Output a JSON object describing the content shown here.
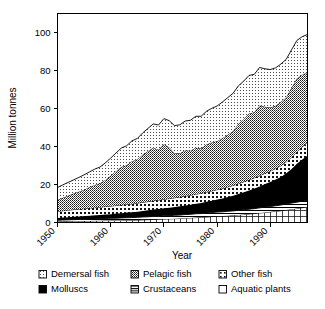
{
  "chart_data": {
    "type": "area",
    "title": "",
    "xlabel": "Year",
    "ylabel": "Million tonnes",
    "xlim": [
      1950,
      1997
    ],
    "ylim": [
      0,
      110
    ],
    "yticks": [
      0,
      20,
      40,
      60,
      80,
      100
    ],
    "xticks": [
      1950,
      1960,
      1970,
      1980,
      1990
    ],
    "grid": false,
    "legend_position": "bottom",
    "stacked": true,
    "stack_order_bottom_to_top": [
      "Aquatic plants",
      "Crustaceans",
      "Molluscs",
      "Other fish",
      "Pelagic fish",
      "Demersal fish"
    ],
    "x": [
      1950,
      1951,
      1952,
      1953,
      1954,
      1955,
      1956,
      1957,
      1958,
      1959,
      1960,
      1961,
      1962,
      1963,
      1964,
      1965,
      1966,
      1967,
      1968,
      1969,
      1970,
      1971,
      1972,
      1973,
      1974,
      1975,
      1976,
      1977,
      1978,
      1979,
      1980,
      1981,
      1982,
      1983,
      1984,
      1985,
      1986,
      1987,
      1988,
      1989,
      1990,
      1991,
      1992,
      1993,
      1994,
      1995,
      1996,
      1997
    ],
    "series": [
      {
        "name": "Aquatic plants",
        "pattern": "grid",
        "color": "#ffffff",
        "values": [
          0.5,
          0.6,
          0.6,
          0.7,
          0.7,
          0.8,
          0.8,
          0.9,
          0.9,
          1.0,
          1.0,
          1.1,
          1.1,
          1.2,
          1.2,
          1.3,
          1.4,
          1.5,
          1.6,
          1.7,
          1.8,
          1.9,
          2.0,
          2.1,
          2.3,
          2.4,
          2.6,
          2.7,
          2.9,
          3.1,
          3.3,
          3.4,
          3.6,
          3.8,
          4.0,
          4.2,
          4.5,
          4.7,
          5.0,
          5.3,
          5.6,
          5.9,
          6.2,
          6.6,
          7.0,
          7.4,
          7.8,
          8.2
        ]
      },
      {
        "name": "Crustaceans",
        "pattern": "horizontal-lines",
        "color": "#ffffff",
        "values": [
          0.7,
          0.7,
          0.8,
          0.8,
          0.9,
          0.9,
          1.0,
          1.0,
          1.1,
          1.1,
          1.2,
          1.2,
          1.3,
          1.3,
          1.4,
          1.4,
          1.5,
          1.5,
          1.6,
          1.6,
          1.7,
          1.7,
          1.8,
          1.8,
          1.9,
          1.9,
          2.0,
          2.0,
          2.1,
          2.1,
          2.2,
          2.2,
          2.3,
          2.3,
          2.4,
          2.5,
          2.5,
          2.6,
          2.7,
          2.8,
          2.8,
          2.9,
          3.0,
          3.1,
          3.2,
          3.3,
          3.4,
          3.5
        ]
      },
      {
        "name": "Molluscs",
        "pattern": "solid-black",
        "color": "#000000",
        "values": [
          1.2,
          1.3,
          1.4,
          1.5,
          1.6,
          1.7,
          1.8,
          1.9,
          2.0,
          2.1,
          2.2,
          2.4,
          2.5,
          2.7,
          2.8,
          3.0,
          3.2,
          3.4,
          3.6,
          3.8,
          4.0,
          4.2,
          4.4,
          4.6,
          4.8,
          5.0,
          5.3,
          5.6,
          5.9,
          6.2,
          6.6,
          7.0,
          7.5,
          8.0,
          8.6,
          9.2,
          9.9,
          10.6,
          11.3,
          12.1,
          12.9,
          13.8,
          14.8,
          16.2,
          18.0,
          20.2,
          22.0,
          23.5
        ]
      },
      {
        "name": "Other fish",
        "pattern": "coarse-dots",
        "color": "#ffffff",
        "values": [
          3.5,
          3.6,
          3.7,
          3.8,
          3.8,
          3.9,
          4.0,
          4.0,
          4.1,
          4.2,
          4.2,
          4.3,
          4.3,
          4.4,
          4.4,
          4.5,
          4.5,
          4.6,
          4.6,
          4.7,
          4.7,
          4.8,
          4.8,
          4.9,
          4.9,
          5.0,
          5.0,
          5.1,
          5.1,
          5.2,
          5.2,
          5.3,
          5.3,
          5.4,
          5.4,
          5.5,
          5.5,
          5.6,
          5.6,
          5.7,
          5.7,
          5.8,
          5.9,
          6.0,
          6.2,
          6.4,
          6.6,
          6.8
        ]
      },
      {
        "name": "Pelagic fish",
        "pattern": "dense-dots-gray",
        "color": "#808080",
        "values": [
          6.0,
          6.8,
          7.6,
          8.4,
          9.2,
          10.0,
          11.0,
          12.0,
          12.5,
          14.0,
          16.0,
          18.0,
          20.0,
          20.5,
          22.5,
          23.0,
          25.0,
          26.5,
          28.0,
          26.5,
          29.0,
          27.0,
          23.5,
          23.0,
          24.0,
          23.5,
          24.5,
          23.5,
          25.0,
          25.5,
          25.5,
          26.5,
          27.5,
          28.5,
          31.5,
          33.0,
          35.0,
          34.5,
          37.0,
          35.0,
          33.5,
          33.0,
          33.5,
          34.0,
          36.5,
          38.5,
          38.0,
          37.0
        ]
      },
      {
        "name": "Demersal fish",
        "pattern": "fine-dots",
        "color": "#ffffff",
        "values": [
          6.5,
          6.8,
          7.0,
          7.2,
          7.5,
          7.8,
          8.0,
          8.3,
          8.6,
          9.0,
          9.3,
          9.6,
          10.0,
          10.3,
          10.7,
          11.0,
          11.5,
          12.0,
          12.5,
          13.0,
          13.5,
          14.0,
          14.5,
          15.0,
          15.5,
          16.0,
          16.5,
          17.0,
          17.5,
          18.0,
          18.5,
          19.0,
          19.5,
          20.0,
          20.0,
          20.0,
          20.0,
          20.0,
          20.0,
          20.0,
          20.0,
          20.0,
          20.0,
          20.0,
          20.0,
          20.0,
          20.0,
          20.0
        ]
      }
    ],
    "totals": [
      18.4,
      19.8,
      21.1,
      22.4,
      23.7,
      25.1,
      26.6,
      28.1,
      29.2,
      31.4,
      33.9,
      36.6,
      39.2,
      40.4,
      43.0,
      44.2,
      47.1,
      49.5,
      51.9,
      51.3,
      54.7,
      53.6,
      51.0,
      51.4,
      53.4,
      53.8,
      55.9,
      55.9,
      58.5,
      60.1,
      61.3,
      63.4,
      65.7,
      68.0,
      71.9,
      74.4,
      77.4,
      78.0,
      81.6,
      80.9,
      80.5,
      81.4,
      83.4,
      85.9,
      90.9,
      95.8,
      97.8,
      99.0
    ]
  },
  "legend": {
    "items": [
      {
        "label": "Demersal fish",
        "swatch": "fine-dots"
      },
      {
        "label": "Pelagic fish",
        "swatch": "dense-dots-gray"
      },
      {
        "label": "Other fish",
        "swatch": "coarse-dots"
      },
      {
        "label": "Molluscs",
        "swatch": "solid-black"
      },
      {
        "label": "Crustaceans",
        "swatch": "horizontal-lines"
      },
      {
        "label": "Aquatic plants",
        "swatch": "grid"
      }
    ]
  },
  "axes": {
    "y_tick_labels": [
      "0",
      "20",
      "40",
      "60",
      "80",
      "100"
    ],
    "x_tick_labels": [
      "1950",
      "1960",
      "1970",
      "1980",
      "1990"
    ],
    "y_axis_title": "Million tonnes",
    "x_axis_title": "Year"
  }
}
